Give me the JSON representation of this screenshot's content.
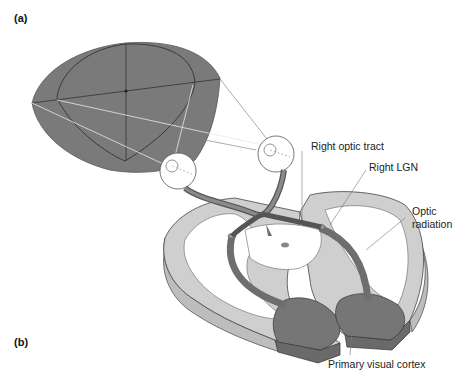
{
  "figure": {
    "panels": [
      {
        "id": "a",
        "label": "(a)"
      },
      {
        "id": "b",
        "label": "(b)"
      }
    ],
    "labels": {
      "right_optic_tract": "Right optic tract",
      "right_lgn": "Right LGN",
      "optic_radiation_line1": "Optic",
      "optic_radiation_line2": "radiation",
      "primary_visual_cortex": "Primary visual cortex"
    },
    "colors": {
      "visual_field": "#7a7a7a",
      "white_matter": "#ffffff",
      "gray_matter": "#c8c8c8",
      "pathway": "#6e6e6e",
      "cortex_v1": "#767676",
      "outline": "#333333"
    }
  }
}
